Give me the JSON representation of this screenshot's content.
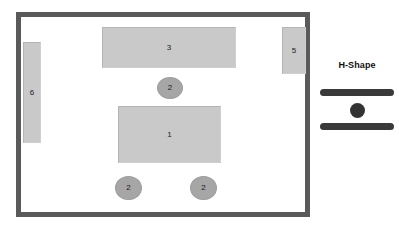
{
  "diagram": {
    "title": "",
    "room": {
      "name": "room-outline",
      "wall_color": "#5a5a5a"
    },
    "shapes": {
      "rect_fill": "#c9c9c9",
      "ellipse_fill": "#a6a6a6",
      "rectangles": [
        {
          "id": "rect-3",
          "label": "3"
        },
        {
          "id": "rect-1",
          "label": "1"
        },
        {
          "id": "rect-5",
          "label": "5"
        },
        {
          "id": "rect-6",
          "label": "6"
        }
      ],
      "ellipses": [
        {
          "id": "ell-top",
          "label": "2"
        },
        {
          "id": "ell-bot-l",
          "label": "2"
        },
        {
          "id": "ell-bot-r",
          "label": "2"
        }
      ]
    },
    "legend": {
      "title": "H-Shape",
      "bar_color": "#3a3a3a",
      "dot_color": "#333333"
    }
  }
}
